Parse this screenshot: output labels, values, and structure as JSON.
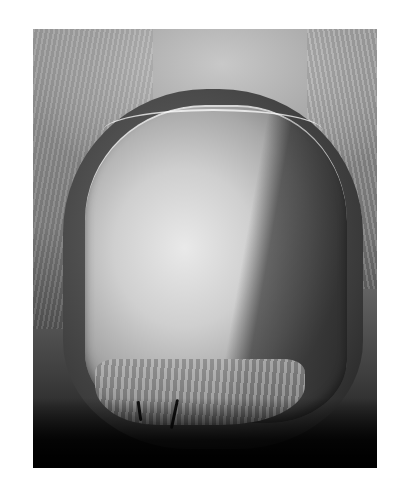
{
  "image": {
    "subject": "fingernail photograph",
    "colorMode": "grayscale",
    "background": "#ffffff",
    "tones": {
      "highlight": "#e9e9e9",
      "midtone": "#9a9a9a",
      "shadow": "#0d0d0d"
    }
  }
}
